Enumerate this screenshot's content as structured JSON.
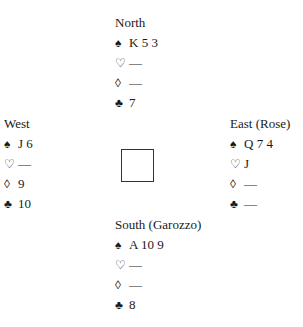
{
  "hands": {
    "north": {
      "name": "North",
      "spades": "K 5 3",
      "hearts": "—",
      "diamonds": "—",
      "clubs": "7"
    },
    "west": {
      "name": "West",
      "spades": "J 6",
      "hearts": "—",
      "diamonds": "9",
      "clubs": "10"
    },
    "east": {
      "name": "East (Rose)",
      "spades": "Q 7 4",
      "hearts": "J",
      "diamonds": "—",
      "clubs": "—"
    },
    "south": {
      "name": "South (Garozzo)",
      "spades": "A 10 9",
      "hearts": "—",
      "diamonds": "—",
      "clubs": "8"
    }
  },
  "suits": {
    "spades": "♠",
    "hearts": "♡",
    "diamonds": "◊",
    "clubs": "♣"
  }
}
